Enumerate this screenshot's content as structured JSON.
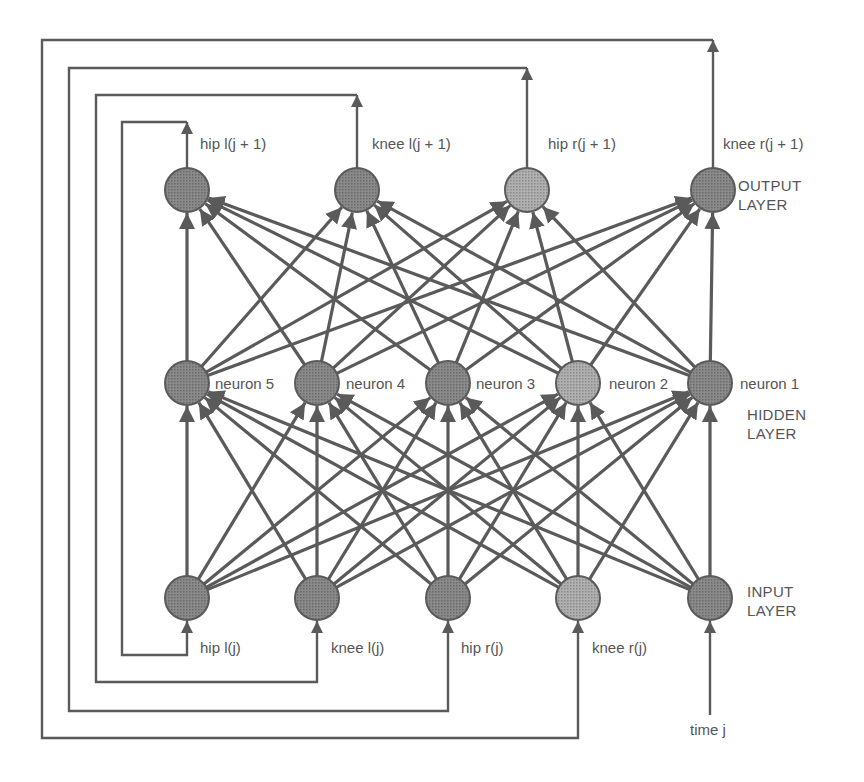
{
  "colors": {
    "line": "#5a5a5a",
    "node_dark": "#7a7a7a",
    "node_light": "#9c9c9c",
    "text": "#555555",
    "background": "#ffffff"
  },
  "layers": {
    "output": {
      "label_line1": "OUTPUT",
      "label_line2": "LAYER",
      "nodes": [
        {
          "id": "out1",
          "label": "hip  l(j + 1)",
          "x": 187,
          "y": 190,
          "shade": "dark"
        },
        {
          "id": "out2",
          "label": "knee  l(j + 1)",
          "x": 357,
          "y": 190,
          "shade": "dark"
        },
        {
          "id": "out3",
          "label": "hip  r(j + 1)",
          "x": 527,
          "y": 190,
          "shade": "light"
        },
        {
          "id": "out4",
          "label": "knee  r(j + 1)",
          "x": 713,
          "y": 190,
          "shade": "dark"
        }
      ]
    },
    "hidden": {
      "label_line1": "HIDDEN",
      "label_line2": "LAYER",
      "nodes": [
        {
          "id": "h5",
          "label": "neuron 5",
          "x": 187,
          "y": 383,
          "shade": "dark"
        },
        {
          "id": "h4",
          "label": "neuron 4",
          "x": 317,
          "y": 383,
          "shade": "dark"
        },
        {
          "id": "h3",
          "label": "neuron 3",
          "x": 448,
          "y": 383,
          "shade": "dark"
        },
        {
          "id": "h2",
          "label": "neuron 2",
          "x": 578,
          "y": 383,
          "shade": "light"
        },
        {
          "id": "h1",
          "label": "neuron 1",
          "x": 710,
          "y": 383,
          "shade": "dark"
        }
      ]
    },
    "input": {
      "label_line1": "INPUT",
      "label_line2": "LAYER",
      "nodes": [
        {
          "id": "in1",
          "label": "hip  l(j)",
          "x": 187,
          "y": 598,
          "shade": "dark"
        },
        {
          "id": "in2",
          "label": "knee  l(j)",
          "x": 317,
          "y": 598,
          "shade": "dark"
        },
        {
          "id": "in3",
          "label": "hip  r(j)",
          "x": 448,
          "y": 598,
          "shade": "dark"
        },
        {
          "id": "in4",
          "label": "knee  r(j)",
          "x": 578,
          "y": 598,
          "shade": "light"
        },
        {
          "id": "in5",
          "label": "time j",
          "x": 710,
          "y": 598,
          "shade": "dark"
        }
      ]
    }
  },
  "connections": "fully-connected input→hidden and hidden→output",
  "feedback_loops": [
    {
      "from": "out1",
      "to": "in1",
      "top_y": 122,
      "left_x": 122,
      "bottom_y": 655
    },
    {
      "from": "out2",
      "to": "in2",
      "top_y": 95,
      "left_x": 96,
      "bottom_y": 682
    },
    {
      "from": "out3",
      "to": "in3",
      "top_y": 68,
      "left_x": 69,
      "bottom_y": 711
    },
    {
      "from": "out4",
      "to": "in4",
      "top_y": 40,
      "left_x": 42,
      "bottom_y": 738
    }
  ],
  "external_input": {
    "label": "time j",
    "from_y": 715
  }
}
